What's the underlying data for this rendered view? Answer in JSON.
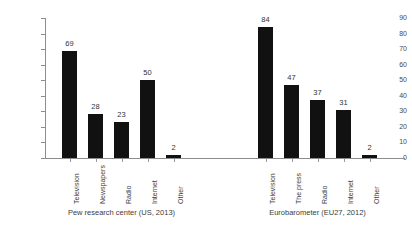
{
  "chart_data": {
    "type": "bar",
    "title": "",
    "xlabel": "",
    "ylabel": "",
    "ylim": [
      0,
      90
    ],
    "yticks": [
      0,
      10,
      20,
      30,
      40,
      50,
      60,
      70,
      80,
      90
    ],
    "grid": false,
    "legend": "none",
    "groups": [
      {
        "caption": "Pew research center (US, 2013)",
        "categories": [
          "Television",
          "Newspapers",
          "Radio",
          "Internet",
          "Other"
        ],
        "values": [
          69,
          28,
          23,
          50,
          2
        ]
      },
      {
        "caption": "Eurobarometer (EU27, 2012)",
        "categories": [
          "Television",
          "The press",
          "Radio",
          "Internet",
          "Other"
        ],
        "values": [
          84,
          47,
          37,
          31,
          2
        ]
      }
    ],
    "colors": {
      "bar": "#111111",
      "axis": "#8d8d8d",
      "text": "#3d3d3d",
      "background": "#ffffff"
    }
  }
}
